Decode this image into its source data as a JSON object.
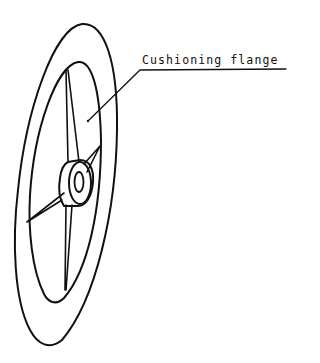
{
  "figure": {
    "type": "technical line drawing",
    "stroke_color": "#111111",
    "background_color": "#ffffff"
  },
  "annotations": [
    {
      "label": "Cushioning flange",
      "points_to": "flange ring between inner and outer rim"
    }
  ]
}
